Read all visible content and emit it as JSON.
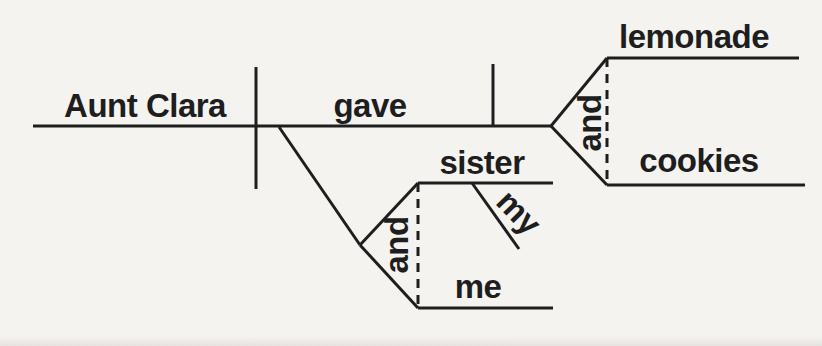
{
  "colors": {
    "ink": "#1e1e1e",
    "background": "#f5f3f0"
  },
  "diagram": {
    "type": "reed-kellogg-sentence-diagram",
    "subject": "Aunt Clara",
    "verb": "gave",
    "direct_objects": {
      "conjunction": "and",
      "items": [
        "lemonade",
        "cookies"
      ]
    },
    "indirect_objects": {
      "conjunction": "and",
      "items": [
        {
          "word": "sister",
          "modifier": "my"
        },
        {
          "word": "me"
        }
      ]
    }
  }
}
